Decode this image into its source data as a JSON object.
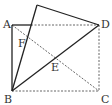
{
  "diagram": {
    "type": "geometry-fold",
    "points": {
      "A": {
        "label": "A",
        "x": 12,
        "y": 25
      },
      "B": {
        "label": "B",
        "x": 12,
        "y": 91
      },
      "C": {
        "label": "C",
        "x": 99,
        "y": 91
      },
      "D": {
        "label": "D",
        "x": 99,
        "y": 25
      },
      "E": {
        "label": "E",
        "x": 55.5,
        "y": 58
      },
      "F": {
        "label": "F",
        "x": 27,
        "y": 36
      },
      "P": {
        "label": "",
        "x": 37,
        "y": 5
      }
    },
    "label_positions": {
      "A": {
        "x": 3,
        "y": 28
      },
      "D": {
        "x": 101,
        "y": 28
      },
      "F": {
        "x": 18,
        "y": 47
      },
      "E": {
        "x": 51,
        "y": 71
      },
      "B": {
        "x": 4,
        "y": 103
      },
      "C": {
        "x": 101,
        "y": 103
      }
    },
    "solid_segments": [
      [
        "A",
        "B"
      ],
      [
        "B",
        "P"
      ],
      [
        "P",
        "D"
      ],
      [
        "D",
        "B"
      ]
    ],
    "dashed_segments": [
      [
        "A",
        "C"
      ],
      [
        "B",
        "C"
      ],
      [
        "C",
        "D"
      ]
    ],
    "colors": {
      "stroke": "#222222",
      "dashed": "#555555",
      "label": "#333333"
    }
  }
}
